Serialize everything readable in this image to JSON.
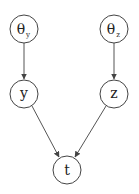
{
  "diagram": {
    "type": "bayesian-network",
    "nodes": [
      {
        "id": "theta_y",
        "label": "θ",
        "subscript": "y",
        "cx": 24,
        "cy": 29,
        "r": 14
      },
      {
        "id": "theta_z",
        "label": "θ",
        "subscript": "z",
        "cx": 114,
        "cy": 29,
        "r": 14
      },
      {
        "id": "y",
        "label": "y",
        "subscript": "",
        "cx": 24,
        "cy": 94,
        "r": 14
      },
      {
        "id": "z",
        "label": "z",
        "subscript": "",
        "cx": 114,
        "cy": 94,
        "r": 14
      },
      {
        "id": "t",
        "label": "t",
        "subscript": "",
        "cx": 67,
        "cy": 170,
        "r": 14
      }
    ],
    "edges": [
      {
        "from": "theta_y",
        "to": "y"
      },
      {
        "from": "theta_z",
        "to": "z"
      },
      {
        "from": "y",
        "to": "t"
      },
      {
        "from": "z",
        "to": "t"
      }
    ]
  }
}
